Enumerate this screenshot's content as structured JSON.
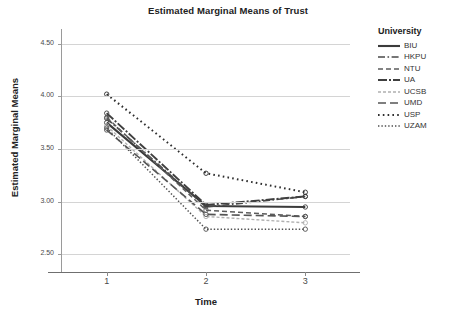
{
  "chart_data": {
    "type": "line",
    "title": "Estimated Marginal Means of Trust",
    "xlabel": "Time",
    "ylabel": "Estimated Marginal Means",
    "x": [
      1,
      2,
      3
    ],
    "categories": [
      "1",
      "2",
      "3"
    ],
    "xtick_labels": [
      "1",
      "2",
      "3"
    ],
    "ytick_labels": [
      "4.50",
      "4.00",
      "3.50",
      "3.00",
      "2.50"
    ],
    "ytick_values": [
      4.5,
      4.0,
      3.5,
      3.0,
      2.5
    ],
    "ylim": [
      2.4,
      4.6
    ],
    "xlim": [
      0.55,
      3.45
    ],
    "grid": "horizontal",
    "legend_position": "right",
    "legend_title": "University",
    "markers": "circle",
    "series": [
      {
        "name": "BIU",
        "values": [
          3.75,
          2.96,
          2.95
        ],
        "dash": "solid",
        "color": "#3b3b3b",
        "width": 2.1
      },
      {
        "name": "HKPU",
        "values": [
          3.79,
          2.95,
          3.05
        ],
        "dash": "dashdot",
        "color": "#4a4a4a",
        "width": 1.7
      },
      {
        "name": "NTU",
        "values": [
          3.8,
          2.92,
          2.86
        ],
        "dash": "dashed",
        "color": "#5c5c5c",
        "width": 1.5
      },
      {
        "name": "UA",
        "values": [
          3.84,
          2.97,
          3.05
        ],
        "dash": "longdashdot",
        "color": "#3f3f3f",
        "width": 1.9
      },
      {
        "name": "UCSB",
        "values": [
          3.72,
          2.86,
          2.8
        ],
        "dash": "finedash",
        "color": "#b0b0b0",
        "width": 1.4
      },
      {
        "name": "UMD",
        "values": [
          3.68,
          2.88,
          2.86
        ],
        "dash": "longdash",
        "color": "#555555",
        "width": 1.6
      },
      {
        "name": "USP",
        "values": [
          4.02,
          3.27,
          3.09
        ],
        "dash": "dotted",
        "color": "#2e2e2e",
        "width": 2.0
      },
      {
        "name": "UZAM",
        "values": [
          3.7,
          2.74,
          2.74
        ],
        "dash": "finedot",
        "color": "#4f4f4f",
        "width": 1.5
      }
    ]
  },
  "legend": {
    "title": "University",
    "items": [
      {
        "label": "BIU"
      },
      {
        "label": "HKPU"
      },
      {
        "label": "NTU"
      },
      {
        "label": "UA"
      },
      {
        "label": "UCSB"
      },
      {
        "label": "UMD"
      },
      {
        "label": "USP"
      },
      {
        "label": "UZAM"
      }
    ]
  }
}
